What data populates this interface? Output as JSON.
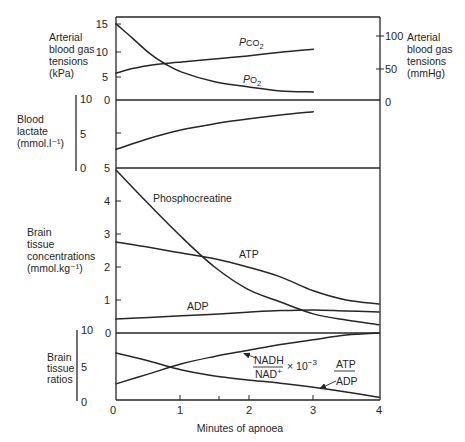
{
  "figure": {
    "x_axis": {
      "label": "Minutes of apnoea",
      "ticks": [
        "0",
        "1",
        "2",
        "3",
        "4"
      ]
    },
    "panels": {
      "gas": {
        "label_lines": [
          "Arterial",
          "blood gas",
          "tensions",
          "(kPa)"
        ],
        "left_ticks": [
          "15",
          "10",
          "5",
          "0"
        ],
        "right_label_lines": [
          "Arterial",
          "blood gas",
          "tensions",
          "(mmHg)"
        ],
        "right_ticks": [
          "100",
          "50",
          "0"
        ],
        "curve_labels": {
          "pco2": {
            "p": "P",
            "gas": "CO",
            "sub": "2"
          },
          "po2": {
            "p": "P",
            "gas": "O",
            "sub": "2"
          }
        }
      },
      "lactate": {
        "label_lines": [
          "Blood",
          "lactate",
          "(mmol.l⁻¹)"
        ],
        "scale_ticks": [
          "10",
          "5",
          "0"
        ]
      },
      "concentrations": {
        "label_lines": [
          "Brain",
          "tissue",
          "concentrations",
          "(mmol.kg⁻¹)"
        ],
        "left_ticks": [
          "5",
          "4",
          "3",
          "2",
          "1",
          "0"
        ],
        "curve_labels": {
          "pcr": "Phosphocreatine",
          "atp": "ATP",
          "adp": "ADP"
        }
      },
      "ratios": {
        "label_lines": [
          "Brain",
          "tissue",
          "ratios"
        ],
        "scale_ticks": [
          "10",
          "5",
          "0"
        ],
        "curve_labels": {
          "nadh_num": "NADH",
          "nadh_den": "NAD",
          "nadh_den_sup": "+",
          "multiplier": "× 10",
          "multiplier_exp": "−3",
          "atp_num": "ATP",
          "atp_den": "ADP"
        }
      }
    }
  },
  "chart_data": [
    {
      "type": "line",
      "title": "Arterial blood gas tensions",
      "xlabel": "Minutes of apnoea",
      "ylabel": "Arterial blood gas tensions (kPa)",
      "y2label": "Arterial blood gas tensions (mmHg)",
      "x": [
        0,
        0.25,
        0.5,
        0.75,
        1,
        1.5,
        2,
        2.5,
        3
      ],
      "series": [
        {
          "name": "PO2",
          "values": [
            15.0,
            12.2,
            9.3,
            7.1,
            5.5,
            3.6,
            2.6,
            1.8,
            1.6
          ]
        },
        {
          "name": "PCO2",
          "values": [
            5.3,
            6.2,
            6.8,
            7.2,
            7.5,
            8.1,
            8.7,
            9.4,
            10.0
          ]
        }
      ],
      "xlim": [
        0,
        4
      ],
      "ylim": [
        0,
        15
      ],
      "yticks": [
        0,
        5,
        10,
        15
      ],
      "y2ticks": [
        0,
        50,
        100
      ],
      "grid": false
    },
    {
      "type": "line",
      "title": "Blood lactate",
      "ylabel": "Blood lactate (mmol.l⁻¹)",
      "x": [
        0,
        0.5,
        1,
        1.5,
        2,
        2.5,
        3
      ],
      "series": [
        {
          "name": "Blood lactate",
          "values": [
            2.8,
            4.4,
            5.7,
            6.6,
            7.3,
            7.9,
            8.4
          ]
        }
      ],
      "xlim": [
        0,
        4
      ],
      "ylim": [
        0,
        10
      ],
      "yticks": [
        0,
        5,
        10
      ],
      "grid": false
    },
    {
      "type": "line",
      "title": "Brain tissue concentrations",
      "ylabel": "Brain tissue concentrations (mmol.kg⁻¹)",
      "x": [
        0,
        0.5,
        1,
        1.5,
        2,
        2.5,
        3,
        3.5,
        4
      ],
      "series": [
        {
          "name": "Phosphocreatine",
          "values": [
            4.94,
            3.9,
            2.9,
            2.0,
            1.33,
            0.94,
            0.58,
            0.39,
            0.25
          ]
        },
        {
          "name": "ATP",
          "values": [
            2.76,
            2.6,
            2.42,
            2.25,
            2.0,
            1.7,
            1.28,
            1.0,
            0.88
          ]
        },
        {
          "name": "ADP",
          "values": [
            0.42,
            0.47,
            0.52,
            0.57,
            0.63,
            0.68,
            0.7,
            0.67,
            0.64
          ]
        }
      ],
      "xlim": [
        0,
        4
      ],
      "ylim": [
        0,
        5
      ],
      "yticks": [
        0,
        1,
        2,
        3,
        4,
        5
      ],
      "grid": false
    },
    {
      "type": "line",
      "title": "Brain tissue ratios",
      "xlabel": "Minutes of apnoea",
      "ylabel": "Brain tissue ratios",
      "x": [
        0,
        0.5,
        1,
        1.5,
        2,
        2.5,
        3,
        3.5,
        4
      ],
      "series": [
        {
          "name": "NADH/NAD+ × 10^-3",
          "values": [
            2.4,
            3.9,
            5.4,
            6.5,
            7.4,
            8.3,
            9.0,
            9.7,
            10.0
          ]
        },
        {
          "name": "ATP/ADP",
          "values": [
            7.0,
            5.8,
            4.5,
            3.6,
            3.0,
            2.5,
            1.9,
            1.2,
            0.4
          ]
        }
      ],
      "xlim": [
        0,
        4
      ],
      "xticks": [
        0,
        1,
        2,
        3,
        4
      ],
      "ylim": [
        0,
        10
      ],
      "yticks": [
        0,
        5,
        10
      ],
      "grid": false
    }
  ]
}
